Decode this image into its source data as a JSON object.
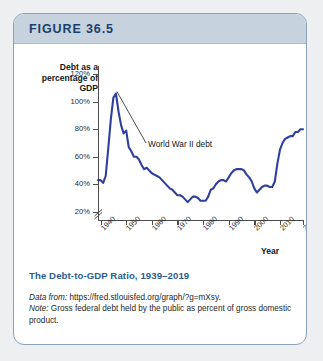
{
  "figure": {
    "header_label": "FIGURE 36.5",
    "caption_title": "The Debt-to-GDP Ratio, 1939–2019",
    "source_prefix": "Data from:",
    "source_url": "https://fred.stlouisfed.org/graph/?g=mXsy.",
    "note_prefix": "Note:",
    "note_text": "Gross federal debt held by the public as percent of gross domestic product.",
    "colors": {
      "header_bg": "#c6d2dd",
      "header_text": "#1b3f6b",
      "card_border": "#8ba2bb",
      "line": "#2f3f9e",
      "caption_title": "#2b5c8f",
      "axis": "#4d4d4d",
      "page_bg": "#edeff0"
    }
  },
  "chart_data": {
    "type": "line",
    "title": "The Debt-to-GDP Ratio, 1939–2019",
    "xlabel": "Year",
    "ylabel": "Debt as a percentage of GDP",
    "ylabel_lines": [
      "Debt as a",
      "percentage of",
      "GDP"
    ],
    "ytick_labels": [
      "20%",
      "40%",
      "60%",
      "80%",
      "100%",
      "120%"
    ],
    "ytick_values": [
      20,
      40,
      60,
      80,
      100,
      120
    ],
    "xtick_labels": [
      "1940",
      "1950",
      "1960",
      "1970",
      "1980",
      "1990",
      "2000",
      "2010",
      "2019"
    ],
    "xtick_values": [
      1940,
      1950,
      1960,
      1970,
      1980,
      1990,
      2000,
      2010,
      2019
    ],
    "xlim": [
      1939,
      2019
    ],
    "ylim": [
      14,
      126
    ],
    "grid": false,
    "legend": null,
    "axis_break_y": true,
    "annotations": [
      {
        "text": "World War II debt",
        "points_to_year": 1946,
        "points_to_value": 106
      }
    ],
    "series": [
      {
        "name": "Gross federal debt held by the public (% of GDP)",
        "color": "#2f3f9e",
        "x": [
          1939,
          1940,
          1941,
          1942,
          1943,
          1944,
          1945,
          1946,
          1947,
          1948,
          1949,
          1950,
          1951,
          1952,
          1953,
          1954,
          1955,
          1956,
          1957,
          1958,
          1959,
          1960,
          1961,
          1962,
          1963,
          1964,
          1965,
          1966,
          1967,
          1968,
          1969,
          1970,
          1971,
          1972,
          1973,
          1974,
          1975,
          1976,
          1977,
          1978,
          1979,
          1980,
          1981,
          1982,
          1983,
          1984,
          1985,
          1986,
          1987,
          1988,
          1989,
          1990,
          1991,
          1992,
          1993,
          1994,
          1995,
          1996,
          1997,
          1998,
          1999,
          2000,
          2001,
          2002,
          2003,
          2004,
          2005,
          2006,
          2007,
          2008,
          2009,
          2010,
          2011,
          2012,
          2013,
          2014,
          2015,
          2016,
          2017,
          2018,
          2019
        ],
        "y": [
          43,
          43,
          41,
          46,
          66,
          87,
          103,
          106,
          93,
          83,
          77,
          79,
          67,
          64,
          60,
          60,
          58,
          54,
          51,
          52,
          50,
          48,
          47,
          46,
          45,
          43,
          41,
          39,
          37,
          36,
          34,
          32,
          32,
          31,
          29,
          27,
          29,
          31,
          31,
          30,
          28,
          28,
          28,
          31,
          36,
          37,
          40,
          42,
          43,
          43,
          42,
          45,
          48,
          50,
          51,
          51,
          51,
          50,
          47,
          45,
          42,
          37,
          34,
          36,
          38,
          39,
          39,
          38,
          38,
          42,
          55,
          65,
          70,
          73,
          74,
          75,
          75,
          78,
          78,
          80,
          80
        ]
      }
    ]
  }
}
